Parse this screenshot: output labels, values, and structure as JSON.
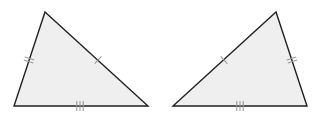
{
  "figure": {
    "type": "geometry-diagram",
    "width": 318,
    "height": 121,
    "background_color": "#ffffff",
    "stroke_color": "#231f20",
    "fill_color": "#efefef",
    "tick_color": "#9a9a9a",
    "stroke_width": 1.4,
    "tick_width": 1.1,
    "shapes": [
      {
        "name": "left-triangle",
        "label": "Triangle 1",
        "vertices": [
          {
            "name": "apex",
            "x": 45,
            "y": 12
          },
          {
            "name": "bottom-right",
            "x": 148,
            "y": 106
          },
          {
            "name": "bottom-left",
            "x": 14,
            "y": 106
          }
        ],
        "sides": [
          {
            "name": "left-side",
            "from": "bottom-left",
            "to": "apex",
            "tick_count": 2,
            "tick_center_x": 29,
            "tick_center_y": 60
          },
          {
            "name": "right-side",
            "from": "apex",
            "to": "bottom-right",
            "tick_count": 1,
            "tick_center_x": 98,
            "tick_center_y": 60
          },
          {
            "name": "bottom-side",
            "from": "bottom-left",
            "to": "bottom-right",
            "tick_count": 3,
            "tick_center_x": 80,
            "tick_center_y": 106
          }
        ]
      },
      {
        "name": "right-triangle",
        "label": "Triangle 2",
        "vertices": [
          {
            "name": "apex",
            "x": 276,
            "y": 12
          },
          {
            "name": "bottom-right",
            "x": 307,
            "y": 106
          },
          {
            "name": "bottom-left",
            "x": 173,
            "y": 106
          }
        ],
        "sides": [
          {
            "name": "left-side",
            "from": "bottom-left",
            "to": "apex",
            "tick_count": 1,
            "tick_center_x": 224,
            "tick_center_y": 60
          },
          {
            "name": "right-side",
            "from": "apex",
            "to": "bottom-right",
            "tick_count": 2,
            "tick_center_x": 292,
            "tick_center_y": 60
          },
          {
            "name": "bottom-side",
            "from": "bottom-left",
            "to": "bottom-right",
            "tick_count": 3,
            "tick_center_x": 240,
            "tick_center_y": 106
          }
        ]
      }
    ]
  }
}
